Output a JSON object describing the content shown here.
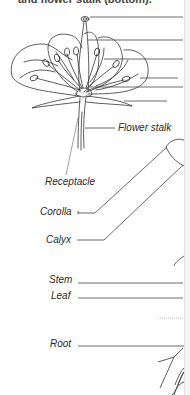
{
  "figure": {
    "caption_partial": "and flower stalk (bottom).",
    "flower_section": {
      "pointer_lines_count": 6,
      "labels": [
        {
          "text": "Flower stalk"
        },
        {
          "text": "Receptacle"
        }
      ]
    },
    "plant_section": {
      "labels": [
        {
          "text": "Corolla"
        },
        {
          "text": "Calyx"
        },
        {
          "text": "Stem"
        },
        {
          "text": "Leaf"
        },
        {
          "text": "Root"
        }
      ]
    },
    "colors": {
      "line": "#333333",
      "text": "#2a2a2a",
      "background": "#ffffff"
    }
  }
}
